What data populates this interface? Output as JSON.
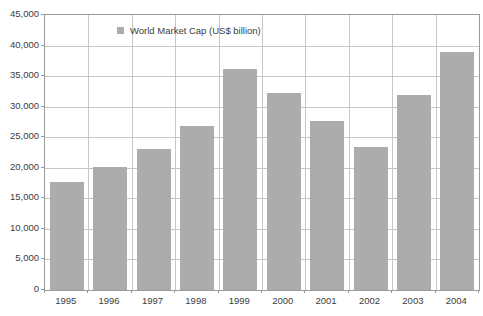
{
  "chart_data": {
    "type": "bar",
    "title": "",
    "xlabel": "",
    "ylabel": "",
    "legend": [
      "World Market Cap (US$ billion)"
    ],
    "legend_position": "top-inside",
    "categories": [
      "1995",
      "1996",
      "1997",
      "1998",
      "1999",
      "2000",
      "2001",
      "2002",
      "2003",
      "2004"
    ],
    "values": [
      17700,
      20200,
      23000,
      26900,
      36100,
      32200,
      27700,
      23400,
      31900,
      38900
    ],
    "ylim": [
      0,
      45000
    ],
    "ytick_step": 5000,
    "grid": true,
    "colors": {
      "bar": "#acacac",
      "gridline": "#c6c6c6",
      "border": "#9a9a9a",
      "text": "#3c3c3c",
      "background": "#ffffff"
    }
  }
}
